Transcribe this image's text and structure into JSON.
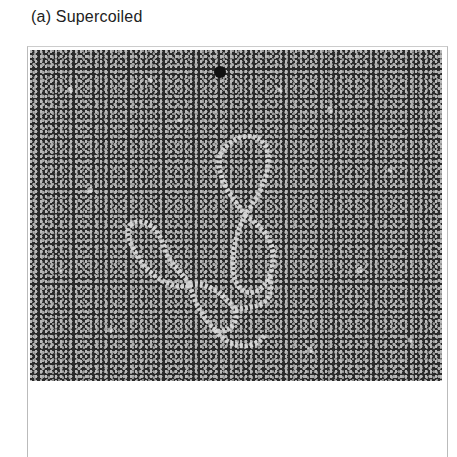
{
  "figure": {
    "caption": "(a) Supercoiled",
    "image_description": "electron-micrograph-supercoiled-dna"
  }
}
